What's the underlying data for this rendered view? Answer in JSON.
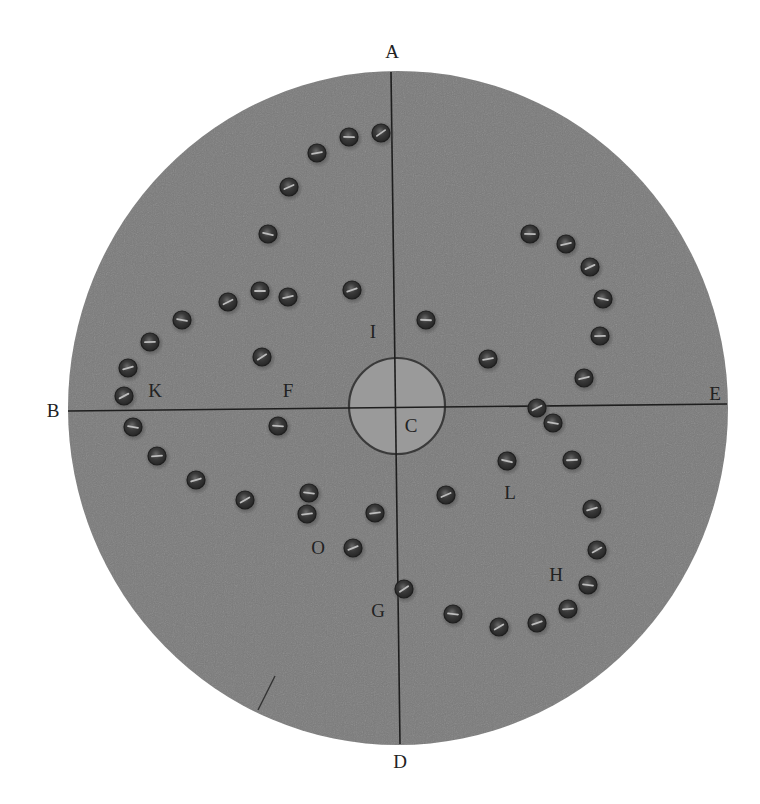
{
  "figure": {
    "colors": {
      "background": "#ffffff",
      "plate": "#7a7a7a",
      "hole": "#9a9a9a",
      "screw_dark": "#2e2e2e",
      "line": "#1e1e1e",
      "label": "#222222"
    },
    "plate": {
      "cx": 398,
      "cy": 408,
      "rx": 330,
      "ry": 337
    },
    "hole": {
      "cx": 397,
      "cy": 406,
      "r": 48
    },
    "axes": [
      {
        "name": "vertical-axis",
        "from": "A",
        "to": "D",
        "x1": 391,
        "y1": 72,
        "x2": 400,
        "y2": 744
      },
      {
        "name": "horizontal-axis",
        "from": "B",
        "to": "E",
        "x1": 68,
        "y1": 411,
        "x2": 727,
        "y2": 404
      }
    ],
    "labels": [
      {
        "id": "A",
        "text": "A",
        "x": 392,
        "y": 51
      },
      {
        "id": "B",
        "text": "B",
        "x": 53,
        "y": 410
      },
      {
        "id": "C",
        "text": "C",
        "x": 411,
        "y": 425
      },
      {
        "id": "D",
        "text": "D",
        "x": 400,
        "y": 761
      },
      {
        "id": "E",
        "text": "E",
        "x": 715,
        "y": 393
      },
      {
        "id": "F",
        "text": "F",
        "x": 288,
        "y": 390
      },
      {
        "id": "G",
        "text": "G",
        "x": 378,
        "y": 610
      },
      {
        "id": "H",
        "text": "H",
        "x": 556,
        "y": 574
      },
      {
        "id": "I",
        "text": "I",
        "x": 373,
        "y": 331
      },
      {
        "id": "K",
        "text": "K",
        "x": 155,
        "y": 390
      },
      {
        "id": "L",
        "text": "L",
        "x": 510,
        "y": 492
      },
      {
        "id": "O",
        "text": "O",
        "x": 318,
        "y": 547
      }
    ],
    "screws": [
      [
        381,
        133
      ],
      [
        349,
        137
      ],
      [
        317,
        153
      ],
      [
        289,
        187
      ],
      [
        268,
        234
      ],
      [
        260,
        291
      ],
      [
        288,
        297
      ],
      [
        228,
        302
      ],
      [
        182,
        320
      ],
      [
        150,
        342
      ],
      [
        128,
        368
      ],
      [
        124,
        396
      ],
      [
        133,
        427
      ],
      [
        157,
        456
      ],
      [
        196,
        480
      ],
      [
        245,
        500
      ],
      [
        309,
        493
      ],
      [
        307,
        514
      ],
      [
        352,
        290
      ],
      [
        262,
        357
      ],
      [
        278,
        426
      ],
      [
        375,
        513
      ],
      [
        353,
        548
      ],
      [
        404,
        589
      ],
      [
        426,
        320
      ],
      [
        488,
        359
      ],
      [
        446,
        495
      ],
      [
        507,
        461
      ],
      [
        530,
        234
      ],
      [
        566,
        244
      ],
      [
        590,
        267
      ],
      [
        603,
        299
      ],
      [
        600,
        336
      ],
      [
        584,
        378
      ],
      [
        537,
        408
      ],
      [
        553,
        423
      ],
      [
        572,
        460
      ],
      [
        592,
        509
      ],
      [
        597,
        550
      ],
      [
        588,
        585
      ],
      [
        568,
        609
      ],
      [
        537,
        623
      ],
      [
        499,
        627
      ],
      [
        453,
        614
      ]
    ],
    "scratch": {
      "x1": 275,
      "y1": 676,
      "x2": 258,
      "y2": 710
    }
  }
}
